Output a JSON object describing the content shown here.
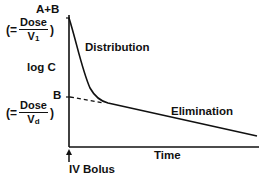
{
  "diagram": {
    "y_axis_label": "log C",
    "x_axis_label": "Time",
    "intercept_top": {
      "label": "A+B",
      "equals_prefix": "(=",
      "numerator": "Dose",
      "denominator": "V",
      "denominator_sub": "1",
      "close": ")"
    },
    "intercept_bottom": {
      "label": "B",
      "equals_prefix": "(=",
      "numerator": "Dose",
      "denominator": "V",
      "denominator_sub": "d",
      "close": ")"
    },
    "phase_labels": {
      "distribution": "Distribution",
      "elimination": "Elimination"
    },
    "dose_marker": "IV Bolus",
    "colors": {
      "line": "#111111",
      "background": "#ffffff"
    }
  }
}
